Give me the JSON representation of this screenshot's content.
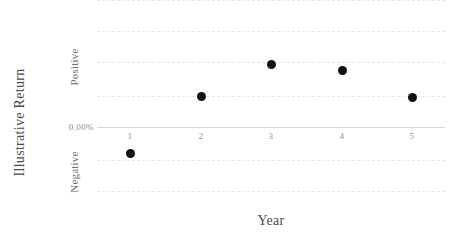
{
  "chart_data": {
    "type": "scatter",
    "title": "",
    "xlabel": "Year",
    "ylabel": "Illustrative Return",
    "categories": [
      "1",
      "2",
      "3",
      "4",
      "5"
    ],
    "x": [
      1,
      2,
      3,
      4,
      5
    ],
    "values": [
      -0.85,
      1.0,
      2.0,
      1.8,
      0.95
    ],
    "y_tick_labels": [
      "Positive",
      "0.00%",
      "Negative"
    ],
    "y_zero_label": "0.00%",
    "y_positive_label": "Positive",
    "y_negative_label": "Negative",
    "ylim": [
      -2.05,
      4.1
    ],
    "xlim": [
      0.5,
      5.5
    ],
    "grid": true,
    "grid_style": "dashed",
    "grid_color": "#e6e6e6",
    "zero_line_color": "#d8d8d8",
    "marker_color": "#111111",
    "marker_size": 9,
    "legend": "none",
    "gridline_values": [
      4.1,
      3.1,
      2.1,
      1.0,
      -1.05,
      -2.05
    ],
    "points": [
      {
        "label": "1",
        "x": 1,
        "y": -0.85,
        "px": 130,
        "py": 153
      },
      {
        "label": "2",
        "x": 2,
        "y": 1.0,
        "px": 201,
        "py": 96
      },
      {
        "label": "3",
        "x": 3,
        "y": 2.0,
        "px": 271,
        "py": 64
      },
      {
        "label": "4",
        "x": 4,
        "y": 1.8,
        "px": 342,
        "py": 70
      },
      {
        "label": "5",
        "x": 5,
        "y": 0.95,
        "px": 412,
        "py": 97
      }
    ]
  },
  "axes": {
    "y_title": "Illustrative Return",
    "x_title": "Year"
  }
}
